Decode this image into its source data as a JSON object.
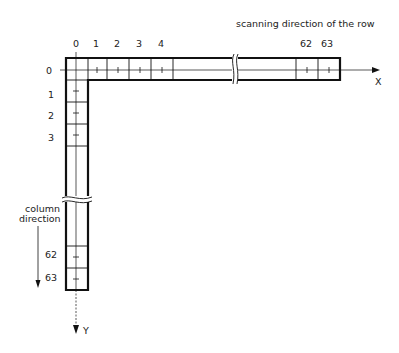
{
  "title": "scanning direction of the row",
  "column_label_line1": "column",
  "column_label_line2": "direction",
  "x_axis_label": "X",
  "y_axis_label": "Y",
  "column_indices": [
    "0",
    "1",
    "2",
    "3",
    "4",
    "62",
    "63"
  ],
  "row_indices": [
    "0",
    "1",
    "2",
    "3",
    "62",
    "63"
  ],
  "colors": {
    "line": "#111111",
    "background": "#ffffff"
  }
}
